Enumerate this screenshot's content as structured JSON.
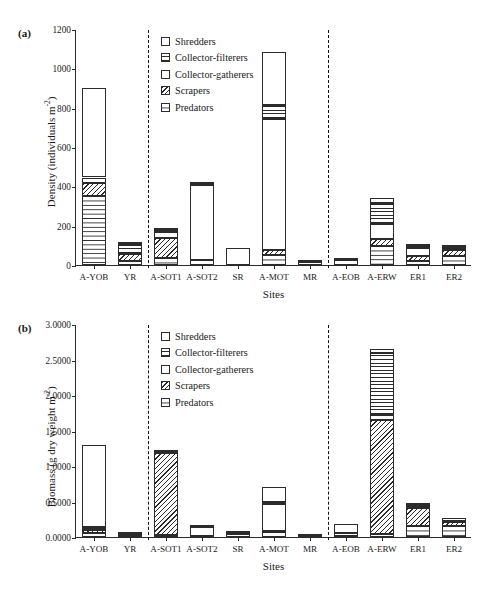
{
  "figure": {
    "panel_a_tag": "(a)",
    "panel_b_tag": "(b)"
  },
  "legend": {
    "items": [
      {
        "label": "Shredders",
        "pattern": "shredders"
      },
      {
        "label": "Collector-filterers",
        "pattern": "filterers"
      },
      {
        "label": "Collector-gatherers",
        "pattern": "gatherers"
      },
      {
        "label": "Scrapers",
        "pattern": "scrapers"
      },
      {
        "label": "Predators",
        "pattern": "predators"
      }
    ]
  },
  "chart_data": [
    {
      "type": "bar",
      "subtype": "stacked-bar",
      "panel": "(a)",
      "title": "",
      "xlabel": "Sites",
      "ylabel": "Density (individuals m⁻²)",
      "ylabel_text": "Density (individuals m",
      "ylabel_sup": "-2",
      "ylabel_tail": ")",
      "ylim": [
        0,
        1200
      ],
      "yticks": [
        0,
        200,
        400,
        600,
        800,
        1000,
        1200
      ],
      "ytick_labels": [
        "0",
        "200",
        "400",
        "600",
        "800",
        "1000",
        "1200"
      ],
      "grid": false,
      "legend_position": "upper-center-left",
      "categories": [
        "A-YOB",
        "YR",
        "A-SOT1",
        "A-SOT2",
        "SR",
        "A-MOT",
        "MR",
        "A-EOB",
        "A-ERW",
        "ER1",
        "ER2"
      ],
      "group_separators_after": [
        "YR",
        "MR"
      ],
      "series": [
        {
          "name": "Predators",
          "values": [
            350,
            22,
            38,
            28,
            0,
            50,
            14,
            0,
            95,
            20,
            48
          ]
        },
        {
          "name": "Scrapers",
          "values": [
            65,
            33,
            100,
            0,
            0,
            28,
            0,
            0,
            35,
            24,
            30
          ]
        },
        {
          "name": "Collector-gatherers",
          "values": [
            30,
            2,
            30,
            378,
            88,
            663,
            2,
            28,
            80,
            45,
            10
          ]
        },
        {
          "name": "Collector-filterers",
          "values": [
            0,
            52,
            8,
            5,
            0,
            75,
            0,
            0,
            105,
            10,
            2
          ]
        },
        {
          "name": "Shredders",
          "values": [
            455,
            6,
            14,
            10,
            0,
            265,
            0,
            2,
            25,
            2,
            8
          ]
        }
      ],
      "totals": [
        900,
        115,
        190,
        421,
        88,
        1081,
        16,
        30,
        340,
        101,
        98
      ]
    },
    {
      "type": "bar",
      "subtype": "stacked-bar",
      "panel": "(b)",
      "title": "",
      "xlabel": "Sites",
      "ylabel": "Biomass (g dry weight m⁻²)",
      "ylabel_text": "Biomass (g dry weight m",
      "ylabel_sup": "-2",
      "ylabel_tail": ")",
      "ylim": [
        0,
        3.0
      ],
      "yticks": [
        0.0,
        0.5,
        1.0,
        1.5,
        2.0,
        2.5,
        3.0
      ],
      "ytick_labels": [
        "0.0000",
        "0.5000",
        "1.0000",
        "1.5000",
        "2.0000",
        "2.5000",
        "3.0000"
      ],
      "grid": false,
      "legend_position": "upper-center-left",
      "categories": [
        "A-YOB",
        "YR",
        "A-SOT1",
        "A-SOT2",
        "SR",
        "A-MOT",
        "MR",
        "A-EOB",
        "A-ERW",
        "ER1",
        "ER2"
      ],
      "group_separators_after": [
        "YR",
        "MR"
      ],
      "series": [
        {
          "name": "Predators",
          "values": [
            0.055,
            0.022,
            0.03,
            0.01,
            0.04,
            0.075,
            0.02,
            0.02,
            0.045,
            0.15,
            0.15
          ]
        },
        {
          "name": "Scrapers",
          "values": [
            0.04,
            0.01,
            1.15,
            0.0,
            0.0,
            0.015,
            0.0,
            0.0,
            1.61,
            0.26,
            0.055
          ]
        },
        {
          "name": "Collector-gatherers",
          "values": [
            0.02,
            0.002,
            0.015,
            0.13,
            0.02,
            0.38,
            0.005,
            0.03,
            0.06,
            0.03,
            0.01
          ]
        },
        {
          "name": "Collector-filterers",
          "values": [
            0.03,
            0.008,
            0.005,
            0.005,
            0.005,
            0.02,
            0.0,
            0.01,
            0.87,
            0.01,
            0.005
          ]
        },
        {
          "name": "Shredders",
          "values": [
            1.155,
            0.003,
            0.01,
            0.005,
            0.0,
            0.22,
            0.0,
            0.12,
            0.06,
            0.03,
            0.045
          ]
        }
      ],
      "totals": [
        1.3,
        0.045,
        1.21,
        0.15,
        0.065,
        0.71,
        0.025,
        0.18,
        2.645,
        0.48,
        0.265
      ]
    }
  ]
}
